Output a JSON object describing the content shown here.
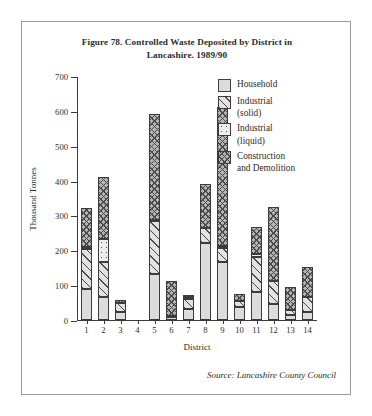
{
  "figure": {
    "title_line1": "Figure 78.  Controlled Waste Deposited by District in",
    "title_line2": "Lancashire. 1989/90",
    "source": "Source: Lancashire County Council"
  },
  "legend": {
    "position": "top-right",
    "items": [
      {
        "label_line1": "Household",
        "label_line2": "",
        "pattern": "solid-light",
        "color": "#dcdcdc"
      },
      {
        "label_line1": "Industrial",
        "label_line2": "(solid)",
        "pattern": "diagonal-hatch",
        "color": "#e2e2e2"
      },
      {
        "label_line1": "Industrial",
        "label_line2": "(liquid)",
        "pattern": "dotted",
        "color": "#ededed"
      },
      {
        "label_line1": "Construction",
        "label_line2": "and Demolition",
        "pattern": "cross-hatch",
        "color": "#b4b4b4"
      }
    ]
  },
  "chart_data": {
    "type": "bar",
    "stacked": true,
    "title": "Figure 78.  Controlled Waste Deposited by District in Lancashire. 1989/90",
    "xlabel": "District",
    "ylabel": "Thousand Tonnes",
    "ylim": [
      0,
      700
    ],
    "yticks": [
      0,
      100,
      200,
      300,
      400,
      500,
      600,
      700
    ],
    "grid": false,
    "categories": [
      "1",
      "2",
      "3",
      "4",
      "5",
      "6",
      "7",
      "8",
      "9",
      "10",
      "11",
      "12",
      "13",
      "14"
    ],
    "series": [
      {
        "name": "Household",
        "values": [
          88,
          66,
          22,
          0,
          133,
          8,
          33,
          221,
          166,
          36,
          79,
          46,
          13,
          23
        ]
      },
      {
        "name": "Industrial (solid)",
        "values": [
          115,
          100,
          27,
          0,
          150,
          4,
          28,
          44,
          42,
          18,
          101,
          66,
          16,
          44
        ]
      },
      {
        "name": "Industrial (liquid)",
        "values": [
          6,
          65,
          0,
          0,
          5,
          0,
          6,
          0,
          3,
          0,
          8,
          0,
          0,
          0
        ]
      },
      {
        "name": "Construction and Demolition",
        "values": [
          113,
          180,
          9,
          0,
          302,
          100,
          2,
          125,
          400,
          21,
          80,
          211,
          66,
          86
        ]
      }
    ],
    "totals": [
      322,
      411,
      58,
      0,
      590,
      112,
      69,
      390,
      611,
      75,
      268,
      323,
      95,
      153
    ]
  }
}
